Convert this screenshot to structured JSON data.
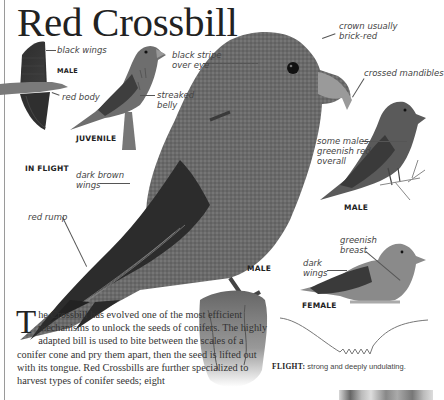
{
  "title": "Red Crossbill",
  "illustrations": {
    "in_flight": {
      "caption": "IN FLIGHT",
      "sex_label": "MALE",
      "annotations": [
        "black wings",
        "red body"
      ]
    },
    "juvenile": {
      "caption": "JUVENILE",
      "annotations": [
        "streaked\nbelly"
      ]
    },
    "main_male": {
      "caption": "MALE",
      "annotations": [
        "black stripe\nover eye",
        "crown usually\nbrick-red",
        "crossed mandibles",
        "dark brown\nwings",
        "red rump"
      ]
    },
    "greenish_male": {
      "caption": "MALE",
      "annotations": [
        "some males\ngreenish red\noverall"
      ]
    },
    "female": {
      "caption": "FEMALE",
      "annotations": [
        "greenish\nbreast",
        "dark\nwings"
      ]
    }
  },
  "flight": {
    "label": "FLIGHT:",
    "description": "strong and deeply undulating."
  },
  "body": {
    "dropcap": "T",
    "text": "he Crossbill has evolved one of the most efficient mechanisms to unlock the seeds of conifers. The highly adapted bill is used to bite between the scales of a conifer cone and pry them apart, then the seed is lifted out with its tongue. Red Crossbills are further specialized to harvest types of conifer seeds; eight"
  }
}
